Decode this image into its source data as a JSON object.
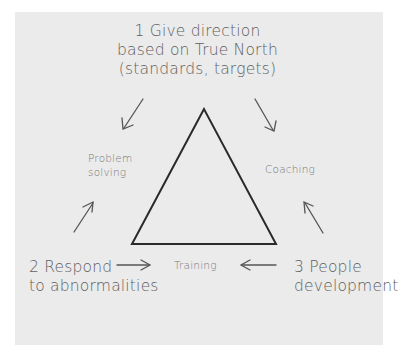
{
  "diagram": {
    "type": "triangle-cycle",
    "top_label": {
      "lines": [
        "1 Give direction",
        "based on True North",
        "(standards, targets)"
      ]
    },
    "bottom_left_label": {
      "lines": [
        "2 Respond",
        "to abnormalities"
      ]
    },
    "bottom_right_label": {
      "lines": [
        "3 People",
        "development"
      ]
    },
    "side_labels": {
      "left": {
        "lines": [
          "Problem",
          "solving"
        ]
      },
      "right": {
        "lines": [
          "Coaching"
        ]
      },
      "bottom": {
        "lines": [
          "Training"
        ]
      }
    },
    "colors": {
      "paper": "#ebebeb",
      "triangle_stroke": "#2a2a2a",
      "arrow_stroke": "#555555",
      "text": "#5f5f5f"
    }
  }
}
